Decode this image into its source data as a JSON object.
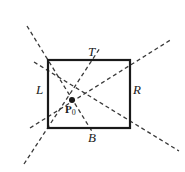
{
  "figure": {
    "background_color": "#ffffff",
    "stroke_color": "#1a1a1a",
    "dash_color": "#3a3a3a",
    "rectangle": {
      "name": "bounding-rectangle",
      "x": 48,
      "y": 60,
      "width": 82,
      "height": 68,
      "stroke_width": 2.2
    },
    "point": {
      "name": "P0",
      "label": "P",
      "subscript": "0",
      "x": 72,
      "y": 100,
      "radius": 3.0
    },
    "edge_labels": [
      {
        "id": "T",
        "text": "T",
        "edge": "top",
        "x": 92,
        "y": 52
      },
      {
        "id": "L",
        "text": "L",
        "edge": "left",
        "x": 40,
        "y": 90
      },
      {
        "id": "R",
        "text": "R",
        "edge": "right",
        "x": 137,
        "y": 90
      },
      {
        "id": "B",
        "text": "B",
        "edge": "bottom",
        "x": 92,
        "y": 138
      }
    ],
    "dashed_rays": [
      {
        "id": "ray-top-left",
        "through_corner": "top-left",
        "corner_x": 48,
        "corner_y": 60,
        "x1": 27,
        "y1": 26,
        "x2": 93,
        "y2": 133
      },
      {
        "id": "ray-top-right",
        "through_corner": "top-right",
        "corner_x": 130,
        "corner_y": 60,
        "x1": 30,
        "y1": 128,
        "x2": 172,
        "y2": 39
      },
      {
        "id": "ray-bottom-left",
        "through_corner": "bottom-left",
        "corner_x": 48,
        "corner_y": 128,
        "x1": 24,
        "y1": 164,
        "x2": 100,
        "y2": 48
      },
      {
        "id": "ray-bottom-right",
        "through_corner": "bottom-right",
        "corner_x": 130,
        "corner_y": 128,
        "x1": 34,
        "y1": 62,
        "x2": 179,
        "y2": 151
      }
    ],
    "dash_pattern": "4 3",
    "dash_width": 1.3
  }
}
